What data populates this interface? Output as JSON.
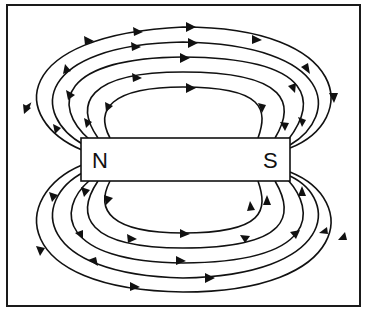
{
  "diagram": {
    "magnet": {
      "north_label": "N",
      "south_label": "S"
    },
    "field_lines": {
      "count_above": 5,
      "count_below": 5,
      "direction": "from N to S (outside the magnet)"
    },
    "colors": {
      "line": "#111111",
      "background": "#ffffff"
    }
  }
}
